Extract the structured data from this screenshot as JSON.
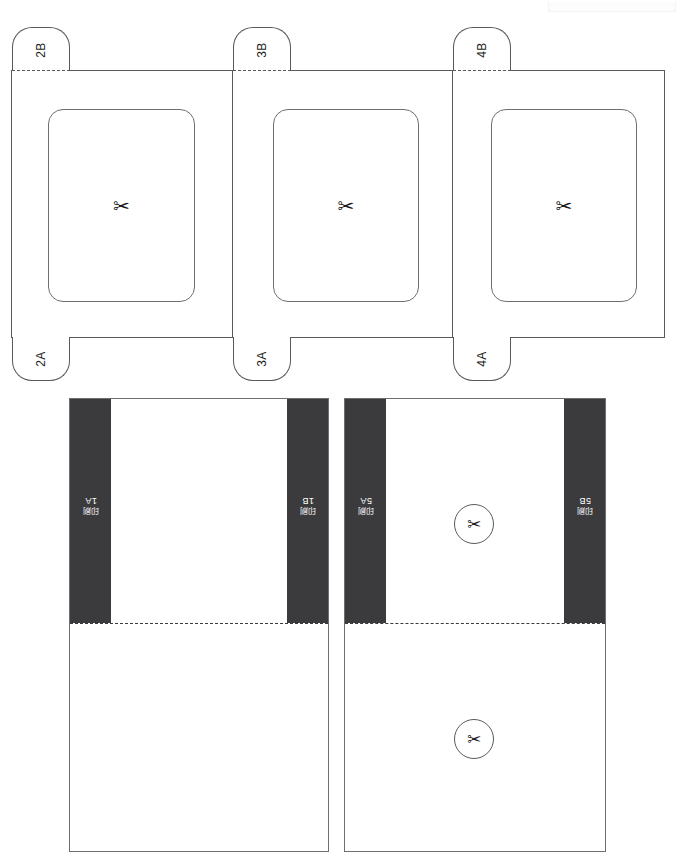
{
  "document": {
    "title": "Packaging Die-Cut Template",
    "sheet_width": 675,
    "sheet_height": 859
  },
  "colors": {
    "outline": "#58595b",
    "inner_outline": "#6d6e71",
    "band_fill": "#3b3b3d",
    "band_text": "#ffffff",
    "paper": "#ffffff",
    "fold_line": "#58595b",
    "registration_patch": "#fcfcfc"
  },
  "icons": {
    "scissors": "✂",
    "scissors_name": "scissors-icon"
  },
  "top_section": {
    "name": "lid-panel-row",
    "panels": [
      {
        "id": "panel-1",
        "window_label": "",
        "cut_marker": "✂",
        "top_tab": {
          "label": "2B",
          "fold": "dash-dot"
        },
        "bottom_tab": {
          "label": "2A",
          "fold": "dash-dot"
        }
      },
      {
        "id": "panel-2",
        "window_label": "",
        "cut_marker": "✂",
        "top_tab": {
          "label": "3B",
          "fold": "dash-dot"
        },
        "bottom_tab": {
          "label": "3A",
          "fold": "dash-dot"
        }
      },
      {
        "id": "panel-3",
        "window_label": "",
        "cut_marker": "✂",
        "top_tab": {
          "label": "4B",
          "fold": "dash-dot"
        },
        "bottom_tab": {
          "label": "4A",
          "fold": "dash-dot"
        }
      }
    ]
  },
  "bottom_section": {
    "name": "body-panel-row",
    "panels": [
      {
        "id": "body-panel-1",
        "left_band": {
          "code": "1A",
          "cjk": "印刷"
        },
        "right_band": {
          "code": "1B",
          "cjk": "印刷"
        },
        "fold": "dash-dot",
        "cut_markers": []
      },
      {
        "id": "body-panel-2",
        "left_band": {
          "code": "5A",
          "cjk": "印刷"
        },
        "right_band": {
          "code": "5B",
          "cjk": "印刷"
        },
        "fold": "dash-dot",
        "cut_markers": [
          "✂",
          "✂"
        ]
      }
    ]
  }
}
